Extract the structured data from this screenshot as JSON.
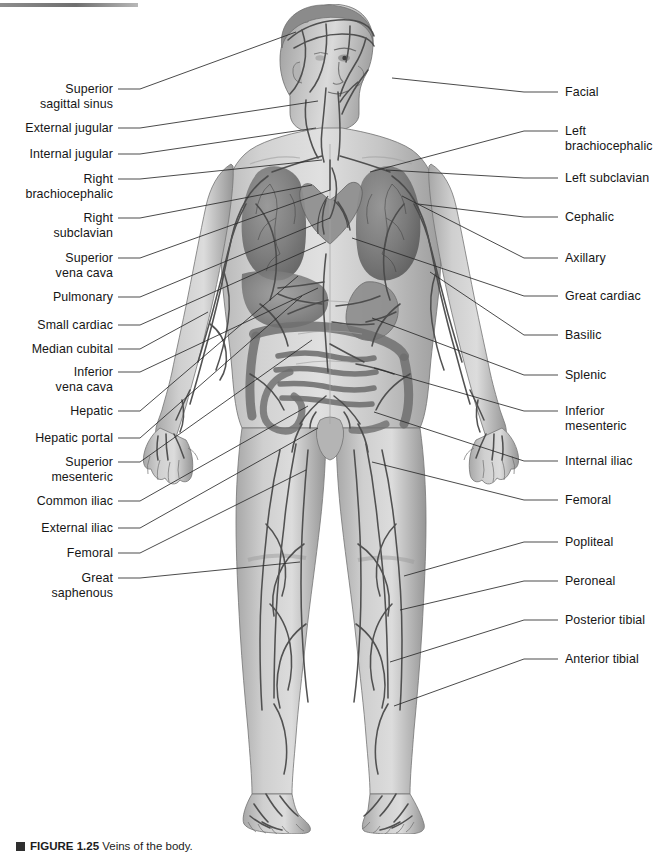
{
  "figure": {
    "title": "Veins of the Body",
    "caption_label": "FIGURE 1.25",
    "caption_text": "Veins of the body.",
    "orientation": "anterior view",
    "art_style": "grayscale airbrushed medical illustration",
    "line_color": "#2b2b2b",
    "text_color": "#161616",
    "background_color": "#ffffff"
  },
  "top_rule": {
    "name": "top-rule",
    "color": "#6f6f6f"
  },
  "labels_left": [
    {
      "id": "superior-sagittal-sinus",
      "text": "Superior\nsagittal sinus",
      "x": 38,
      "y": 82,
      "w": 75,
      "lx": 118,
      "ly": 89,
      "tx": 296,
      "ty": 32
    },
    {
      "id": "external-jugular",
      "text": "External jugular",
      "x": 18,
      "y": 121,
      "w": 95,
      "lx": 118,
      "ly": 128,
      "tx": 318,
      "ty": 101
    },
    {
      "id": "internal-jugular",
      "text": "Internal jugular",
      "x": 22,
      "y": 147,
      "w": 91,
      "lx": 118,
      "ly": 154,
      "tx": 316,
      "ty": 128
    },
    {
      "id": "right-brachiocephalic",
      "text": "Right\nbrachiocephalic",
      "x": 18,
      "y": 172,
      "w": 95,
      "lx": 118,
      "ly": 179,
      "tx": 322,
      "ty": 160
    },
    {
      "id": "right-subclavian",
      "text": "Right\nsubclavian",
      "x": 38,
      "y": 211,
      "w": 75,
      "lx": 118,
      "ly": 218,
      "tx": 312,
      "ty": 185
    },
    {
      "id": "superior-vena-cava",
      "text": "Superior\nvena cava",
      "x": 38,
      "y": 251,
      "w": 75,
      "lx": 118,
      "ly": 258,
      "tx": 330,
      "ty": 190
    },
    {
      "id": "pulmonary",
      "text": "Pulmonary",
      "x": 42,
      "y": 290,
      "w": 71,
      "lx": 118,
      "ly": 297,
      "tx": 330,
      "ty": 218
    },
    {
      "id": "small-cardiac",
      "text": "Small cardiac",
      "x": 28,
      "y": 318,
      "w": 85,
      "lx": 118,
      "ly": 325,
      "tx": 326,
      "ty": 242
    },
    {
      "id": "median-cubital",
      "text": "Median cubital",
      "x": 22,
      "y": 342,
      "w": 91,
      "lx": 118,
      "ly": 349,
      "tx": 208,
      "ty": 312
    },
    {
      "id": "inferior-vena-cava",
      "text": "Inferior\nvena cava",
      "x": 38,
      "y": 365,
      "w": 75,
      "lx": 118,
      "ly": 372,
      "tx": 318,
      "ty": 288
    },
    {
      "id": "hepatic",
      "text": "Hepatic",
      "x": 54,
      "y": 404,
      "w": 59,
      "lx": 118,
      "ly": 411,
      "tx": 298,
      "ty": 276
    },
    {
      "id": "hepatic-portal",
      "text": "Hepatic portal",
      "x": 24,
      "y": 431,
      "w": 89,
      "lx": 118,
      "ly": 438,
      "tx": 302,
      "ty": 296
    },
    {
      "id": "superior-mesenteric",
      "text": "Superior\nmesenteric",
      "x": 38,
      "y": 455,
      "w": 75,
      "lx": 118,
      "ly": 462,
      "tx": 312,
      "ty": 340
    },
    {
      "id": "common-iliac",
      "text": "Common iliac",
      "x": 28,
      "y": 494,
      "w": 85,
      "lx": 118,
      "ly": 501,
      "tx": 308,
      "ty": 406
    },
    {
      "id": "external-iliac",
      "text": "External iliac",
      "x": 29,
      "y": 521,
      "w": 84,
      "lx": 118,
      "ly": 528,
      "tx": 318,
      "ty": 428
    },
    {
      "id": "femoral-left",
      "text": "Femoral",
      "x": 54,
      "y": 546,
      "w": 59,
      "lx": 118,
      "ly": 553,
      "tx": 306,
      "ty": 470
    },
    {
      "id": "great-saphenous",
      "text": "Great\nsaphenous",
      "x": 38,
      "y": 571,
      "w": 75,
      "lx": 118,
      "ly": 578,
      "tx": 300,
      "ty": 562
    }
  ],
  "labels_right": [
    {
      "id": "facial",
      "text": "Facial",
      "x": 565,
      "y": 85,
      "lx": 524,
      "ly": 92,
      "tx": 392,
      "ty": 78
    },
    {
      "id": "left-brachiocephalic",
      "text": "Left\nbrachiocephalic",
      "x": 565,
      "y": 124,
      "lx": 524,
      "ly": 131,
      "tx": 370,
      "ty": 172
    },
    {
      "id": "left-subclavian",
      "text": "Left subclavian",
      "x": 565,
      "y": 171,
      "lx": 524,
      "ly": 178,
      "tx": 386,
      "ty": 170
    },
    {
      "id": "cephalic",
      "text": "Cephalic",
      "x": 565,
      "y": 210,
      "lx": 524,
      "ly": 217,
      "tx": 418,
      "ty": 204
    },
    {
      "id": "axillary",
      "text": "Axillary",
      "x": 565,
      "y": 251,
      "lx": 524,
      "ly": 258,
      "tx": 402,
      "ty": 196
    },
    {
      "id": "great-cardiac",
      "text": "Great cardiac",
      "x": 565,
      "y": 289,
      "lx": 524,
      "ly": 296,
      "tx": 352,
      "ty": 238
    },
    {
      "id": "basilic",
      "text": "Basilic",
      "x": 565,
      "y": 328,
      "lx": 524,
      "ly": 335,
      "tx": 430,
      "ty": 272
    },
    {
      "id": "splenic",
      "text": "Splenic",
      "x": 565,
      "y": 368,
      "lx": 524,
      "ly": 375,
      "tx": 372,
      "ty": 318
    },
    {
      "id": "inferior-mesenteric",
      "text": "Inferior\nmesenteric",
      "x": 565,
      "y": 404,
      "lx": 524,
      "ly": 411,
      "tx": 374,
      "ty": 368
    },
    {
      "id": "internal-iliac",
      "text": "Internal iliac",
      "x": 565,
      "y": 454,
      "lx": 524,
      "ly": 461,
      "tx": 374,
      "ty": 412
    },
    {
      "id": "femoral-right",
      "text": "Femoral",
      "x": 565,
      "y": 493,
      "lx": 524,
      "ly": 500,
      "tx": 372,
      "ty": 462
    },
    {
      "id": "popliteal",
      "text": "Popliteal",
      "x": 565,
      "y": 535,
      "lx": 524,
      "ly": 542,
      "tx": 404,
      "ty": 576
    },
    {
      "id": "peroneal",
      "text": "Peroneal",
      "x": 565,
      "y": 574,
      "lx": 524,
      "ly": 581,
      "tx": 400,
      "ty": 610
    },
    {
      "id": "posterior-tibial",
      "text": "Posterior tibial",
      "x": 565,
      "y": 613,
      "lx": 524,
      "ly": 620,
      "tx": 390,
      "ty": 662
    },
    {
      "id": "anterior-tibial",
      "text": "Anterior tibial",
      "x": 565,
      "y": 652,
      "lx": 524,
      "ly": 659,
      "tx": 394,
      "ty": 706
    }
  ]
}
